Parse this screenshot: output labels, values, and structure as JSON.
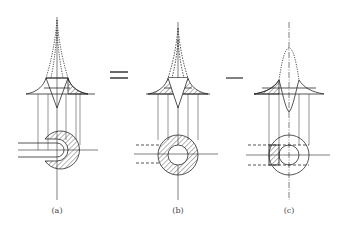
{
  "figure": {
    "panels": [
      {
        "id": "a",
        "label": "(a)",
        "cx": 57
      },
      {
        "id": "b",
        "label": "(b)",
        "cx": 178
      },
      {
        "id": "c",
        "label": "(c)",
        "cx": 289
      }
    ],
    "operators": [
      {
        "symbol": "=",
        "x": 122
      },
      {
        "symbol": "−",
        "x": 234
      }
    ],
    "colors": {
      "ink": "#2a2a2a",
      "background": "#ffffff"
    }
  }
}
